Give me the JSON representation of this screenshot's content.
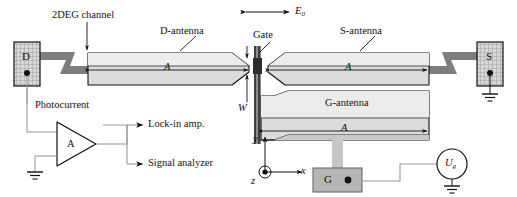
{
  "figure": {
    "background_color": "#ffffff",
    "line_color": "#111111",
    "antenna_fill": "#d9d9d9",
    "antenna_fill_light": "#e8e8e8",
    "channel_fill": "#7d7d7d",
    "gate_fill": "#4a4a4a",
    "pad_fill": "#cfcfcf",
    "gate_pad_fill": "#b0b0b0",
    "wire_color": "#9a9a9a"
  },
  "labels": {
    "two_deg_channel": "2DEG channel",
    "d_antenna": "D-antenna",
    "s_antenna": "S-antenna",
    "g_antenna": "G-antenna",
    "gate": "Gate",
    "field": "E",
    "field_sub": "0",
    "photocurrent": "Photocurrent",
    "lock_in": "Lock-in amp.",
    "signal_analyzer": "Signal analyzer",
    "amplifier": "A",
    "length_d": "A",
    "length_s": "A",
    "length_g": "A",
    "width_w": "W",
    "axis_x": "x",
    "axis_y": "y",
    "axis_z": "z"
  },
  "contacts": [
    {
      "id": "drain",
      "label": "D",
      "name": "drain-contact-pad"
    },
    {
      "id": "source",
      "label": "S",
      "name": "source-contact-pad"
    },
    {
      "id": "gate",
      "label": "G",
      "name": "gate-contact-pad"
    }
  ],
  "source_voltage": {
    "symbol": "U",
    "subscript": "g",
    "name": "gate-voltage-source"
  }
}
